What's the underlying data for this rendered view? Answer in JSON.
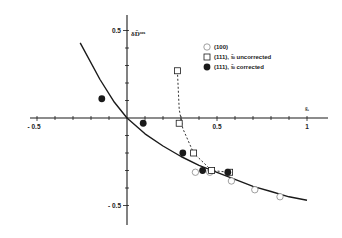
{
  "chart_data": {
    "type": "scatter",
    "title": "",
    "xlabel": "s̃_i",
    "ylabel": "δD̃_s^ox",
    "xlim": [
      -0.5,
      1.05
    ],
    "ylim": [
      -0.55,
      0.55
    ],
    "x_ticks": [
      -0.5,
      0.5,
      1
    ],
    "x_tick_labels": [
      "- 0.5",
      "0.5",
      "1"
    ],
    "y_ticks": [
      0.5,
      -0.5
    ],
    "y_tick_labels": [
      "0.5",
      "- 0.5"
    ],
    "grid": false,
    "legend_position": "upper right",
    "series": [
      {
        "name": "(100)",
        "marker": "open-circle",
        "points": [
          [
            0.38,
            -0.31
          ],
          [
            0.46,
            -0.31
          ],
          [
            0.58,
            -0.36
          ],
          [
            0.71,
            -0.41
          ],
          [
            0.85,
            -0.45
          ]
        ]
      },
      {
        "name": "(111), s̃_i uncorrected",
        "marker": "open-square",
        "points": [
          [
            0.28,
            0.27
          ],
          [
            0.29,
            -0.03
          ],
          [
            0.37,
            -0.2
          ],
          [
            0.47,
            -0.3
          ],
          [
            0.57,
            -0.31
          ]
        ]
      },
      {
        "name": "(111), s̃_i corrected",
        "marker": "filled-circle",
        "points": [
          [
            -0.14,
            0.11
          ],
          [
            0.09,
            -0.03
          ],
          [
            0.31,
            -0.2
          ],
          [
            0.42,
            -0.3
          ],
          [
            0.56,
            -0.31
          ]
        ]
      }
    ],
    "fit_curve": {
      "name": "solid fit",
      "style": "solid",
      "points": [
        [
          -0.26,
          0.43
        ],
        [
          -0.15,
          0.22
        ],
        [
          -0.07,
          0.09
        ],
        [
          0.0,
          0.0
        ],
        [
          0.1,
          -0.09
        ],
        [
          0.2,
          -0.16
        ],
        [
          0.3,
          -0.22
        ],
        [
          0.4,
          -0.27
        ],
        [
          0.5,
          -0.31
        ],
        [
          0.6,
          -0.35
        ],
        [
          0.7,
          -0.39
        ],
        [
          0.8,
          -0.42
        ],
        [
          0.9,
          -0.45
        ],
        [
          1.0,
          -0.47
        ]
      ]
    },
    "dashed_curve": {
      "name": "dashed guide (uncorrected)",
      "style": "dashed",
      "points": [
        [
          0.28,
          0.27
        ],
        [
          0.29,
          0.05
        ],
        [
          0.31,
          -0.06
        ],
        [
          0.37,
          -0.2
        ],
        [
          0.47,
          -0.3
        ],
        [
          0.57,
          -0.31
        ]
      ]
    }
  },
  "legend": {
    "items": [
      {
        "label": "(100)",
        "marker": "open-circle"
      },
      {
        "label": "(111),  s̃ᵢ  uncorrected",
        "marker": "open-square"
      },
      {
        "label": "(111),  s̃ᵢ  corrected",
        "marker": "filled-circle"
      }
    ]
  },
  "axes": {
    "x_title": "s̃ᵢ",
    "y_title": "δD̃ˢᵒˣ"
  },
  "colors": {
    "ink": "#1a1a1a",
    "background": "#ffffff",
    "open_marker_stroke": "#888888"
  }
}
